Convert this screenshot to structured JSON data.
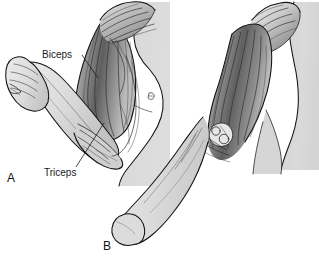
{
  "figure": {
    "background_color": "#ffffff",
    "ink_color": "#111111",
    "skin_fill": "#d8d8d8",
    "skin_fill_light": "#e4e4e4",
    "muscle_dark": "#6a6a6a",
    "muscle_mid": "#9a9a9a",
    "muscle_light": "#c4c4c4",
    "label_color": "#1a1a1a"
  },
  "labels": {
    "biceps": "Biceps",
    "triceps": "Triceps"
  },
  "panels": [
    {
      "letter": "A",
      "name": "flexed-arm",
      "caption": "A",
      "state": "flexed",
      "visible_muscles": [
        "Biceps",
        "Triceps"
      ]
    },
    {
      "letter": "B",
      "name": "extended-arm",
      "caption": "B",
      "state": "extended",
      "visible_muscles": []
    }
  ]
}
